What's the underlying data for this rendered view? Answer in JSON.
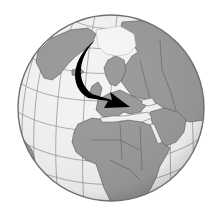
{
  "image": {
    "description": "Grayscale orthographic globe centered on Europe and Africa with a black curved arrow pointing from the Arctic down to southern Europe",
    "colors": {
      "background": "#ffffff",
      "ocean": "#f3f3f3",
      "land": "#9a9a9a",
      "borders": "#555555",
      "graticule": "#8c8c8c",
      "rim": "#6f6f6f",
      "arrow": "#000000"
    },
    "globe": {
      "cx": 111,
      "cy": 108,
      "r": 93
    },
    "arrow": {
      "start": [
        95,
        42
      ],
      "end": [
        130,
        106
      ],
      "label": ""
    }
  }
}
